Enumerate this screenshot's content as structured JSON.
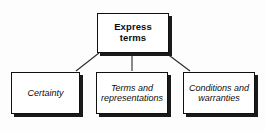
{
  "diagram": {
    "type": "hierarchy-tree",
    "title": "Express terms",
    "background_color": "#fdfdfd",
    "border_color": "#111111",
    "shadow_color": "#1a1a1a",
    "root": {
      "id": "express-terms",
      "label": "Express terms",
      "style": "bold"
    },
    "children": [
      {
        "id": "certainty",
        "label": "Certainty",
        "style": "italic"
      },
      {
        "id": "terms-and-representations",
        "label": "Terms and representations",
        "style": "italic"
      },
      {
        "id": "conditions-and-warranties",
        "label": "Conditions and warranties",
        "style": "italic"
      }
    ],
    "connectors": [
      {
        "from": "express-terms",
        "to": "certainty",
        "kind": "elbow-diagonal"
      },
      {
        "from": "express-terms",
        "to": "terms-and-representations",
        "kind": "vertical"
      },
      {
        "from": "express-terms",
        "to": "conditions-and-warranties",
        "kind": "elbow-diagonal"
      }
    ]
  }
}
